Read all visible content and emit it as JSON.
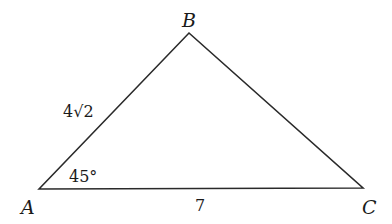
{
  "diagram": {
    "type": "triangle",
    "stroke_color": "#2a2a2a",
    "background": "#ffffff",
    "vertices": [
      {
        "name": "A",
        "x": 39,
        "y": 189
      },
      {
        "name": "B",
        "x": 189,
        "y": 33
      },
      {
        "name": "C",
        "x": 363,
        "y": 188
      }
    ],
    "labels": {
      "vertex_a": "A",
      "vertex_b": "B",
      "vertex_c": "C",
      "side_ab": "4√2",
      "side_ac": "7",
      "angle_a": "45°"
    }
  }
}
